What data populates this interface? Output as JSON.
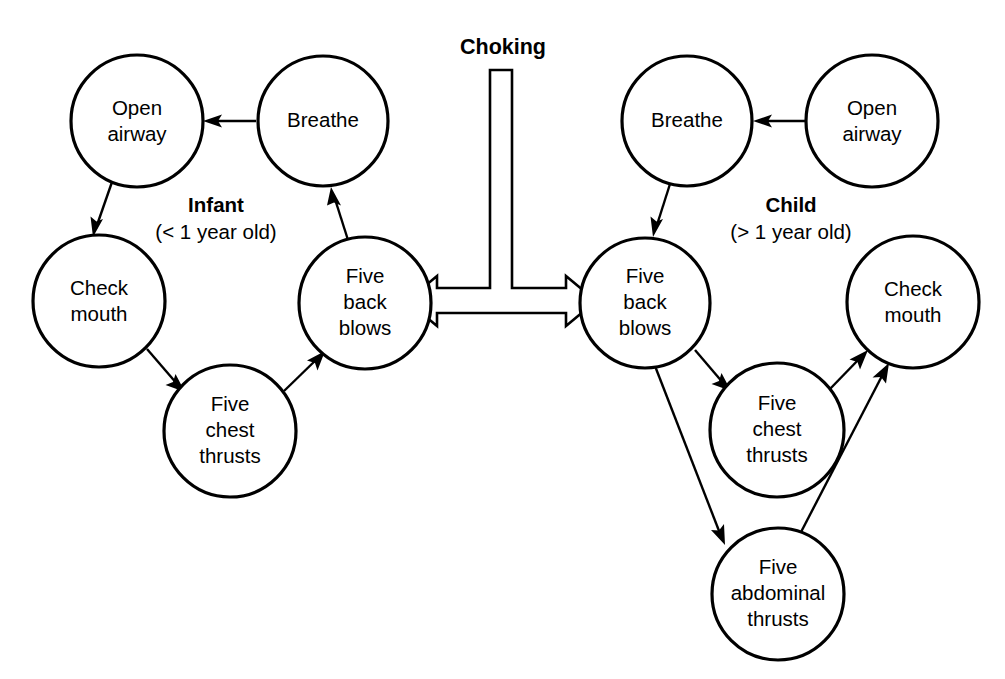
{
  "diagram": {
    "title": "Choking",
    "groups": [
      {
        "id": "infant",
        "title": "Infant",
        "subtitle": "(< 1 year old)"
      },
      {
        "id": "child",
        "title": "Child",
        "subtitle": "(> 1 year old)"
      }
    ],
    "nodes": {
      "infant_open_airway": {
        "line1": "Open",
        "line2": "airway",
        "line3": ""
      },
      "infant_breathe": {
        "line1": "Breathe",
        "line2": "",
        "line3": ""
      },
      "infant_check_mouth": {
        "line1": "Check",
        "line2": "mouth",
        "line3": ""
      },
      "infant_chest_thrusts": {
        "line1": "Five",
        "line2": "chest",
        "line3": "thrusts"
      },
      "infant_back_blows": {
        "line1": "Five",
        "line2": "back",
        "line3": "blows"
      },
      "child_breathe": {
        "line1": "Breathe",
        "line2": "",
        "line3": ""
      },
      "child_open_airway": {
        "line1": "Open",
        "line2": "airway",
        "line3": ""
      },
      "child_back_blows": {
        "line1": "Five",
        "line2": "back",
        "line3": "blows"
      },
      "child_chest_thrusts": {
        "line1": "Five",
        "line2": "chest",
        "line3": "thrusts"
      },
      "child_abdominal_thrusts": {
        "line1": "Five",
        "line2": "abdominal",
        "line3": "thrusts"
      },
      "child_check_mouth": {
        "line1": "Check",
        "line2": "mouth",
        "line3": ""
      }
    },
    "colors": {
      "stroke": "#000000",
      "fill": "#ffffff",
      "background": "#ffffff"
    }
  }
}
